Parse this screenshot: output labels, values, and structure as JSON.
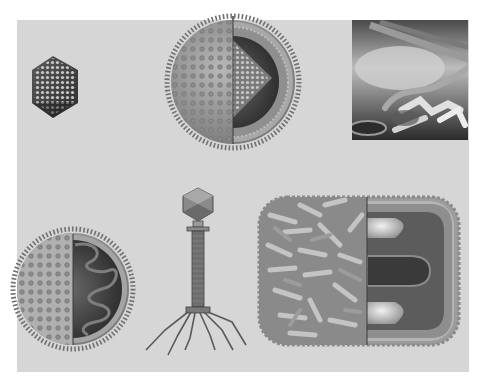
{
  "figure": {
    "background": "#ffffff",
    "panel_color": "#d6d6d6",
    "subjects": [
      {
        "id": "icosahedral-virus",
        "label": "Icosahedral virus particle"
      },
      {
        "id": "enveloped-virus-cutaway",
        "label": "Enveloped spherical virus, cutaway showing capsid"
      },
      {
        "id": "electron-micrograph",
        "label": "Electron micrograph of filamentous particles"
      },
      {
        "id": "enveloped-rna-virus",
        "label": "Enveloped virus, cutaway showing coiled genome"
      },
      {
        "id": "bacteriophage",
        "label": "Bacteriophage with head, tail and tail fibers"
      },
      {
        "id": "poxvirus",
        "label": "Brick-shaped poxvirus, cutaway showing core and lateral bodies"
      }
    ]
  }
}
